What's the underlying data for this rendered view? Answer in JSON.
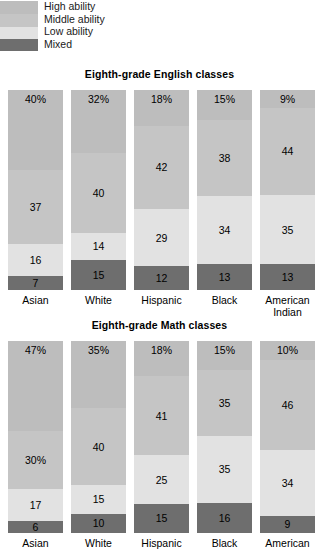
{
  "legend": {
    "items": [
      {
        "label": "High ability",
        "color": "#bdbdbd"
      },
      {
        "label": "Middle ability",
        "color": "#c5c5c5"
      },
      {
        "label": "Low ability",
        "color": "#e2e2e2"
      },
      {
        "label": "Mixed",
        "color": "#6e6e6e"
      }
    ]
  },
  "colors": {
    "high": "#bdbdbd",
    "middle": "#c5c5c5",
    "low": "#e2e2e2",
    "mixed": "#6e6e6e",
    "text": "#000000",
    "background": "#ffffff"
  },
  "charts": [
    {
      "id": "english",
      "title": "Eighth-grade English classes",
      "categories": [
        "Asian",
        "White",
        "Hispanic",
        "Black",
        "American Indian"
      ],
      "category_lines": [
        [
          "Asian"
        ],
        [
          "White"
        ],
        [
          "Hispanic"
        ],
        [
          "Black"
        ],
        [
          "American",
          "Indian"
        ]
      ],
      "bars": [
        {
          "category": "Asian",
          "segments": [
            {
              "series": "High ability",
              "value": 40,
              "label": "40%"
            },
            {
              "series": "Middle ability",
              "value": 37,
              "label": "37"
            },
            {
              "series": "Low ability",
              "value": 16,
              "label": "16"
            },
            {
              "series": "Mixed",
              "value": 7,
              "label": "7"
            }
          ]
        },
        {
          "category": "White",
          "segments": [
            {
              "series": "High ability",
              "value": 32,
              "label": "32%"
            },
            {
              "series": "Middle ability",
              "value": 40,
              "label": "40"
            },
            {
              "series": "Low ability",
              "value": 14,
              "label": "14"
            },
            {
              "series": "Mixed",
              "value": 15,
              "label": "15"
            }
          ]
        },
        {
          "category": "Hispanic",
          "segments": [
            {
              "series": "High ability",
              "value": 18,
              "label": "18%"
            },
            {
              "series": "Middle ability",
              "value": 42,
              "label": "42"
            },
            {
              "series": "Low ability",
              "value": 29,
              "label": "29"
            },
            {
              "series": "Mixed",
              "value": 12,
              "label": "12"
            }
          ]
        },
        {
          "category": "Black",
          "segments": [
            {
              "series": "High ability",
              "value": 15,
              "label": "15%"
            },
            {
              "series": "Middle ability",
              "value": 38,
              "label": "38"
            },
            {
              "series": "Low ability",
              "value": 34,
              "label": "34"
            },
            {
              "series": "Mixed",
              "value": 13,
              "label": "13"
            }
          ]
        },
        {
          "category": "American Indian",
          "segments": [
            {
              "series": "High ability",
              "value": 9,
              "label": "9%"
            },
            {
              "series": "Middle ability",
              "value": 44,
              "label": "44"
            },
            {
              "series": "Low ability",
              "value": 35,
              "label": "35"
            },
            {
              "series": "Mixed",
              "value": 13,
              "label": "13"
            }
          ]
        }
      ]
    },
    {
      "id": "math",
      "title": "Eighth-grade Math classes",
      "categories": [
        "Asian",
        "White",
        "Hispanic",
        "Black",
        "American"
      ],
      "category_lines": [
        [
          "Asian"
        ],
        [
          "White"
        ],
        [
          "Hispanic"
        ],
        [
          "Black"
        ],
        [
          "American"
        ]
      ],
      "bars": [
        {
          "category": "Asian",
          "segments": [
            {
              "series": "High ability",
              "value": 47,
              "label": "47%"
            },
            {
              "series": "Middle ability",
              "value": 30,
              "label": "30%"
            },
            {
              "series": "Low ability",
              "value": 17,
              "label": "17"
            },
            {
              "series": "Mixed",
              "value": 6,
              "label": "6"
            }
          ]
        },
        {
          "category": "White",
          "segments": [
            {
              "series": "High ability",
              "value": 35,
              "label": "35%"
            },
            {
              "series": "Middle ability",
              "value": 40,
              "label": "40"
            },
            {
              "series": "Low ability",
              "value": 15,
              "label": "15"
            },
            {
              "series": "Mixed",
              "value": 10,
              "label": "10"
            }
          ]
        },
        {
          "category": "Hispanic",
          "segments": [
            {
              "series": "High ability",
              "value": 18,
              "label": "18%"
            },
            {
              "series": "Middle ability",
              "value": 41,
              "label": "41"
            },
            {
              "series": "Low ability",
              "value": 25,
              "label": "25"
            },
            {
              "series": "Mixed",
              "value": 15,
              "label": "15"
            }
          ]
        },
        {
          "category": "Black",
          "segments": [
            {
              "series": "High ability",
              "value": 15,
              "label": "15%"
            },
            {
              "series": "Middle ability",
              "value": 35,
              "label": "35"
            },
            {
              "series": "Low ability",
              "value": 35,
              "label": "35"
            },
            {
              "series": "Mixed",
              "value": 16,
              "label": "16"
            }
          ]
        },
        {
          "category": "American",
          "segments": [
            {
              "series": "High ability",
              "value": 10,
              "label": "10%"
            },
            {
              "series": "Middle ability",
              "value": 46,
              "label": "46"
            },
            {
              "series": "Low ability",
              "value": 34,
              "label": "34"
            },
            {
              "series": "Mixed",
              "value": 9,
              "label": "9"
            }
          ]
        }
      ]
    }
  ],
  "chart_data": [
    {
      "type": "bar",
      "subtype": "stacked-100",
      "title": "Eighth-grade English classes",
      "xlabel": "",
      "ylabel": "",
      "ylim": [
        0,
        100
      ],
      "grid": false,
      "legend_position": "top-left",
      "orientation": "vertical",
      "stack_order_top_to_bottom": [
        "High ability",
        "Middle ability",
        "Low ability",
        "Mixed"
      ],
      "categories": [
        "Asian",
        "White",
        "Hispanic",
        "Black",
        "American Indian"
      ],
      "series": [
        {
          "name": "High ability",
          "values": [
            40,
            32,
            18,
            15,
            9
          ]
        },
        {
          "name": "Middle ability",
          "values": [
            37,
            40,
            42,
            38,
            44
          ]
        },
        {
          "name": "Low ability",
          "values": [
            16,
            14,
            29,
            34,
            35
          ]
        },
        {
          "name": "Mixed",
          "values": [
            7,
            15,
            12,
            13,
            13
          ]
        }
      ],
      "data_labels": [
        [
          "40%",
          "37",
          "16",
          "7"
        ],
        [
          "32%",
          "40",
          "14",
          "15"
        ],
        [
          "18%",
          "42",
          "29",
          "12"
        ],
        [
          "15%",
          "38",
          "34",
          "13"
        ],
        [
          "9%",
          "44",
          "35",
          "13"
        ]
      ]
    },
    {
      "type": "bar",
      "subtype": "stacked-100",
      "title": "Eighth-grade Math classes",
      "xlabel": "",
      "ylabel": "",
      "ylim": [
        0,
        100
      ],
      "grid": false,
      "legend_position": "top-left",
      "orientation": "vertical",
      "stack_order_top_to_bottom": [
        "High ability",
        "Middle ability",
        "Low ability",
        "Mixed"
      ],
      "categories": [
        "Asian",
        "White",
        "Hispanic",
        "Black",
        "American"
      ],
      "series": [
        {
          "name": "High ability",
          "values": [
            47,
            35,
            18,
            15,
            10
          ]
        },
        {
          "name": "Middle ability",
          "values": [
            30,
            40,
            41,
            35,
            46
          ]
        },
        {
          "name": "Low ability",
          "values": [
            17,
            15,
            25,
            35,
            34
          ]
        },
        {
          "name": "Mixed",
          "values": [
            6,
            10,
            15,
            16,
            9
          ]
        }
      ],
      "data_labels": [
        [
          "47%",
          "30%",
          "17",
          "6"
        ],
        [
          "35%",
          "40",
          "15",
          "10"
        ],
        [
          "18%",
          "41",
          "25",
          "15"
        ],
        [
          "15%",
          "35",
          "35",
          "16"
        ],
        [
          "10%",
          "46",
          "34",
          "9"
        ]
      ],
      "note": "bottom of this chart is cropped in the screenshot"
    }
  ]
}
